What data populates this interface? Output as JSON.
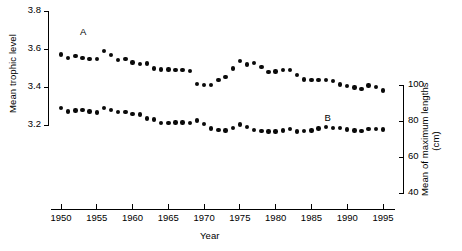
{
  "chart_data": {
    "type": "scatter",
    "title": "",
    "xlabel": "Year",
    "ylabel": "Mean trophic level",
    "ylabel_right": "Mean of maximum lengths",
    "ylabel_right_units": "(cm)",
    "xlim": [
      1949,
      1996
    ],
    "ylim_left": [
      3.2,
      3.8
    ],
    "ylim_right": [
      40,
      100
    ],
    "grid": false,
    "legend": "inline-labels",
    "xticks": [
      1950,
      1955,
      1960,
      1965,
      1970,
      1975,
      1980,
      1985,
      1990,
      1995
    ],
    "yticks_left": [
      "3.2",
      "3.4",
      "3.6",
      "3.8"
    ],
    "yticks_right": [
      "40",
      "60",
      "80",
      "100"
    ],
    "x": [
      1950,
      1951,
      1952,
      1953,
      1954,
      1955,
      1956,
      1957,
      1958,
      1959,
      1960,
      1961,
      1962,
      1963,
      1964,
      1965,
      1966,
      1967,
      1968,
      1969,
      1970,
      1971,
      1972,
      1973,
      1974,
      1975,
      1976,
      1977,
      1978,
      1979,
      1980,
      1981,
      1982,
      1983,
      1984,
      1985,
      1986,
      1987,
      1988,
      1989,
      1990,
      1991,
      1992,
      1993,
      1994,
      1995
    ],
    "series": [
      {
        "name": "A",
        "axis": "left",
        "label": "A",
        "label_x": 1953.2,
        "label_y": 3.685,
        "values": [
          3.572,
          3.552,
          3.562,
          3.553,
          3.548,
          3.548,
          3.588,
          3.568,
          3.543,
          3.548,
          3.528,
          3.52,
          3.524,
          3.497,
          3.492,
          3.492,
          3.488,
          3.489,
          3.483,
          3.417,
          3.409,
          3.41,
          3.438,
          3.452,
          3.498,
          3.536,
          3.518,
          3.527,
          3.505,
          3.478,
          3.482,
          3.489,
          3.49,
          3.463,
          3.44,
          3.436,
          3.436,
          3.436,
          3.432,
          3.414,
          3.406,
          3.398,
          3.388,
          3.408,
          3.4,
          3.382
        ]
      },
      {
        "name": "B",
        "axis": "left",
        "label": "B",
        "label_x": 1987.4,
        "label_y": 3.231,
        "values": [
          3.29,
          3.272,
          3.276,
          3.28,
          3.272,
          3.266,
          3.288,
          3.28,
          3.27,
          3.27,
          3.257,
          3.256,
          3.234,
          3.228,
          3.212,
          3.21,
          3.213,
          3.214,
          3.212,
          3.224,
          3.206,
          3.182,
          3.174,
          3.171,
          3.184,
          3.202,
          3.19,
          3.175,
          3.169,
          3.166,
          3.166,
          3.172,
          3.178,
          3.166,
          3.17,
          3.172,
          3.182,
          3.188,
          3.185,
          3.184,
          3.176,
          3.172,
          3.17,
          3.178,
          3.178,
          3.176
        ]
      }
    ]
  },
  "axes": {
    "left_title": "Mean trophic level",
    "right_title_line1": "Mean of maximum lengths",
    "right_title_line2": "(cm)",
    "bottom_title": "Year"
  }
}
